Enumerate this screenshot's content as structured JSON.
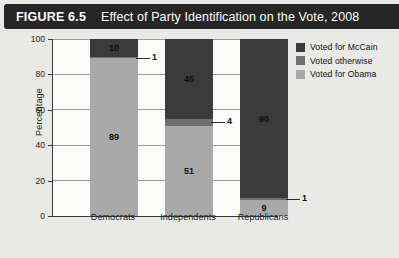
{
  "figure": {
    "number_label": "FIGURE 6.5",
    "title": "Effect of Party Identification on the Vote, 2008"
  },
  "colors": {
    "mccain": "#3b3b3b",
    "otherwise": "#6f6f6f",
    "obama": "#a9a9a9",
    "title_bar_bg": "#262626",
    "title_bar_text": "#ffffff",
    "panel_bg": "#e9e9e7",
    "plot_bg": "#fbfbfa",
    "gridline": "#9a9a9a",
    "axis": "#3a3a3a"
  },
  "legend": {
    "position": "top-right",
    "items": [
      {
        "label": "Voted for McCain",
        "color_key": "mccain"
      },
      {
        "label": "Voted otherwise",
        "color_key": "otherwise"
      },
      {
        "label": "Voted for Obama",
        "color_key": "obama"
      }
    ]
  },
  "axes": {
    "ylabel": "Percentage",
    "yticks": [
      "0",
      "20",
      "40",
      "60",
      "80",
      "100"
    ],
    "xticks": [
      "Democrats",
      "Independents",
      "Republicans"
    ]
  },
  "chart_data": {
    "type": "bar",
    "subtype": "stacked-vertical",
    "title": "Effect of Party Identification on the Vote, 2008",
    "xlabel": "",
    "ylabel": "Percentage",
    "ylim": [
      0,
      100
    ],
    "ytick_interval": 20,
    "grid": true,
    "legend_position": "top-right",
    "categories": [
      "Democrats",
      "Independents",
      "Republicans"
    ],
    "series": [
      {
        "name": "Voted for Obama",
        "color": "#a9a9a9",
        "values": [
          89,
          51,
          9
        ]
      },
      {
        "name": "Voted otherwise",
        "color": "#6f6f6f",
        "values": [
          1,
          4,
          1
        ]
      },
      {
        "name": "Voted for McCain",
        "color": "#3b3b3b",
        "values": [
          10,
          45,
          90
        ]
      }
    ],
    "data_labels": {
      "Democrats": {
        "obama": "89",
        "otherwise": "1",
        "mccain": "10"
      },
      "Independents": {
        "obama": "51",
        "otherwise": "4",
        "mccain": "45"
      },
      "Republicans": {
        "obama": "9",
        "otherwise": "1",
        "mccain": "90"
      }
    }
  }
}
